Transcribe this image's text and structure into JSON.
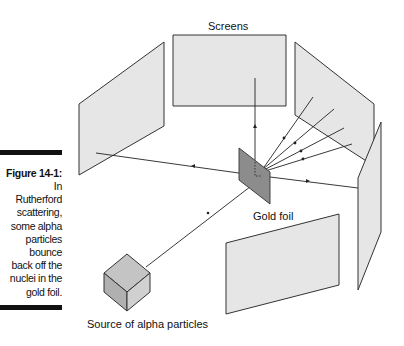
{
  "caption": {
    "title": "Figure 14-1:",
    "body_lines": [
      "In",
      "Rutherford",
      "scattering,",
      "some alpha",
      "particles",
      "bounce",
      "back off the",
      "nuclei in the",
      "gold foil."
    ]
  },
  "diagram": {
    "labels": {
      "screens": "Screens",
      "gold_foil": "Gold foil",
      "source": "Source of alpha particles"
    },
    "colors": {
      "screen_fill": "#e6e6e6",
      "foil_fill": "#8c8c8c",
      "cube_fill": "#bdbdbd",
      "stroke": "#333333"
    }
  }
}
